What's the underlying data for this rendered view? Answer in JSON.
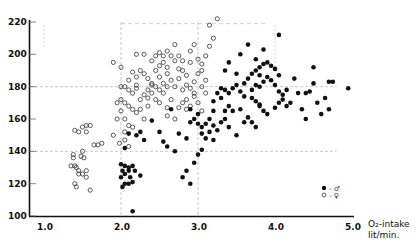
{
  "chart_data": {
    "type": "scatter",
    "title": "",
    "xlabel": "O2-intake lit/min.",
    "xlabel_line1": "O₂-intake",
    "xlabel_line2": "lit/min.",
    "ylabel": "",
    "xlim": [
      0.8,
      5.0
    ],
    "ylim": [
      100,
      220
    ],
    "xticks": [
      1.0,
      2.0,
      3.0,
      4.0,
      5.0
    ],
    "xtick_labels": [
      "1.0",
      "2.0",
      "3.0",
      "4.0",
      "5.0"
    ],
    "yticks": [
      100,
      120,
      140,
      160,
      180,
      200,
      220
    ],
    "ytick_labels": [
      "100",
      "120",
      "140",
      "160",
      "180",
      "200",
      "220"
    ],
    "grid": {
      "x": [
        2.0,
        3.0
      ],
      "y": [
        140,
        180
      ],
      "style": "dashed-light"
    },
    "legend": [
      {
        "marker": "filled-circle",
        "label": "♂",
        "text": "● - ♂"
      },
      {
        "marker": "open-circle",
        "label": "♀",
        "text": "○ - ♀"
      }
    ],
    "legend_position": "lower-right",
    "series": [
      {
        "name": "♀ (female)",
        "marker": "open-circle",
        "points": [
          [
            1.4,
            153
          ],
          [
            1.45,
            152
          ],
          [
            1.5,
            155
          ],
          [
            1.55,
            156
          ],
          [
            1.6,
            156
          ],
          [
            1.55,
            152
          ],
          [
            1.65,
            144
          ],
          [
            1.7,
            144
          ],
          [
            1.75,
            145
          ],
          [
            1.38,
            138
          ],
          [
            1.38,
            136
          ],
          [
            1.5,
            140
          ],
          [
            1.48,
            137
          ],
          [
            1.52,
            136
          ],
          [
            1.4,
            131
          ],
          [
            1.45,
            128
          ],
          [
            1.45,
            126
          ],
          [
            1.55,
            128
          ],
          [
            1.5,
            126
          ],
          [
            1.55,
            124
          ],
          [
            1.4,
            120
          ],
          [
            1.42,
            118
          ],
          [
            1.6,
            116
          ],
          [
            1.35,
            131
          ],
          [
            1.42,
            130
          ],
          [
            1.9,
            150
          ],
          [
            1.95,
            160
          ],
          [
            2.0,
            165
          ],
          [
            2.05,
            160
          ],
          [
            2.1,
            156
          ],
          [
            2.05,
            152
          ],
          [
            2.15,
            155
          ],
          [
            2.05,
            147
          ],
          [
            2.1,
            143
          ],
          [
            1.98,
            145
          ],
          [
            1.95,
            170
          ],
          [
            2.0,
            172
          ],
          [
            2.05,
            170
          ],
          [
            2.1,
            168
          ],
          [
            2.15,
            166
          ],
          [
            2.2,
            164
          ],
          [
            2.0,
            180
          ],
          [
            2.05,
            180
          ],
          [
            2.1,
            178
          ],
          [
            2.15,
            176
          ],
          [
            2.2,
            181
          ],
          [
            2.0,
            192
          ],
          [
            2.1,
            184
          ],
          [
            2.2,
            186
          ],
          [
            2.25,
            190
          ],
          [
            2.3,
            188
          ],
          [
            2.35,
            185
          ],
          [
            2.4,
            182
          ],
          [
            2.3,
            175
          ],
          [
            2.25,
            172
          ],
          [
            2.35,
            178
          ],
          [
            2.4,
            176
          ],
          [
            2.45,
            180
          ],
          [
            2.5,
            186
          ],
          [
            2.55,
            182
          ],
          [
            2.45,
            190
          ],
          [
            2.5,
            193
          ],
          [
            2.55,
            195
          ],
          [
            2.6,
            188
          ],
          [
            2.65,
            184
          ],
          [
            2.7,
            180
          ],
          [
            2.75,
            185
          ],
          [
            2.8,
            190
          ],
          [
            2.85,
            187
          ],
          [
            2.6,
            192
          ],
          [
            2.7,
            196
          ],
          [
            2.75,
            199
          ],
          [
            2.8,
            196
          ],
          [
            2.9,
            195
          ],
          [
            2.95,
            183
          ],
          [
            3.0,
            188
          ],
          [
            3.05,
            194
          ],
          [
            3.1,
            199
          ],
          [
            3.15,
            205
          ],
          [
            3.1,
            184
          ],
          [
            3.05,
            180
          ],
          [
            2.95,
            176
          ],
          [
            2.9,
            179
          ],
          [
            2.85,
            172
          ],
          [
            2.8,
            170
          ],
          [
            2.65,
            172
          ],
          [
            2.55,
            176
          ],
          [
            2.45,
            172
          ],
          [
            2.35,
            168
          ],
          [
            2.25,
            166
          ],
          [
            2.3,
            160
          ],
          [
            2.6,
            162
          ],
          [
            2.7,
            160
          ],
          [
            2.9,
            168
          ],
          [
            3.0,
            170
          ],
          [
            3.05,
            165
          ],
          [
            2.8,
            178
          ],
          [
            2.6,
            180
          ],
          [
            2.5,
            178
          ],
          [
            2.4,
            181
          ],
          [
            2.2,
            179
          ],
          [
            2.15,
            189
          ],
          [
            1.9,
            195
          ],
          [
            2.6,
            202
          ],
          [
            2.5,
            201
          ],
          [
            2.45,
            199
          ],
          [
            2.2,
            200
          ],
          [
            2.3,
            200
          ],
          [
            2.9,
            202
          ],
          [
            2.95,
            206
          ],
          [
            3.15,
            218
          ],
          [
            3.25,
            222
          ],
          [
            3.2,
            210
          ],
          [
            2.7,
            206
          ],
          [
            2.4,
            196
          ],
          [
            2.55,
            199
          ],
          [
            2.65,
            199
          ],
          [
            3.0,
            197
          ],
          [
            3.05,
            190
          ],
          [
            2.75,
            191
          ],
          [
            2.85,
            181
          ],
          [
            3.1,
            176
          ],
          [
            2.95,
            174
          ],
          [
            2.85,
            166
          ],
          [
            2.5,
            170
          ],
          [
            2.35,
            173
          ],
          [
            2.6,
            167
          ],
          [
            2.75,
            167
          ]
        ]
      },
      {
        "name": "♂ (male)",
        "marker": "filled-circle",
        "points": [
          [
            2.0,
            132
          ],
          [
            2.05,
            131
          ],
          [
            2.1,
            130
          ],
          [
            2.15,
            131
          ],
          [
            2.02,
            128
          ],
          [
            2.05,
            126
          ],
          [
            2.1,
            128
          ],
          [
            2.12,
            124
          ],
          [
            2.18,
            128
          ],
          [
            2.0,
            124
          ],
          [
            2.05,
            120
          ],
          [
            2.02,
            118
          ],
          [
            2.1,
            120
          ],
          [
            2.15,
            121
          ],
          [
            2.25,
            125
          ],
          [
            2.05,
            142
          ],
          [
            2.1,
            151
          ],
          [
            2.2,
            150
          ],
          [
            2.25,
            152
          ],
          [
            2.3,
            147
          ],
          [
            2.4,
            159
          ],
          [
            2.5,
            152
          ],
          [
            2.55,
            146
          ],
          [
            2.6,
            143
          ],
          [
            2.7,
            140
          ],
          [
            2.75,
            151
          ],
          [
            2.85,
            148
          ],
          [
            2.9,
            158
          ],
          [
            2.8,
            124
          ],
          [
            2.85,
            128
          ],
          [
            2.9,
            120
          ],
          [
            2.95,
            133
          ],
          [
            3.0,
            138
          ],
          [
            3.05,
            141
          ],
          [
            3.1,
            148
          ],
          [
            3.15,
            152
          ],
          [
            3.2,
            147
          ],
          [
            3.25,
            153
          ],
          [
            2.65,
            166
          ],
          [
            2.9,
            166
          ],
          [
            3.0,
            157
          ],
          [
            3.05,
            155
          ],
          [
            3.1,
            157
          ],
          [
            3.15,
            160
          ],
          [
            3.2,
            156
          ],
          [
            3.3,
            158
          ],
          [
            3.35,
            160
          ],
          [
            3.4,
            155
          ],
          [
            3.5,
            150
          ],
          [
            3.55,
            166
          ],
          [
            3.6,
            158
          ],
          [
            3.2,
            171
          ],
          [
            3.25,
            176
          ],
          [
            3.3,
            179
          ],
          [
            3.35,
            178
          ],
          [
            3.4,
            176
          ],
          [
            3.45,
            179
          ],
          [
            3.5,
            181
          ],
          [
            3.55,
            177
          ],
          [
            3.6,
            174
          ],
          [
            3.3,
            173
          ],
          [
            3.4,
            168
          ],
          [
            3.45,
            165
          ],
          [
            3.35,
            165
          ],
          [
            3.2,
            165
          ],
          [
            3.7,
            173
          ],
          [
            3.75,
            171
          ],
          [
            3.8,
            169
          ],
          [
            3.6,
            182
          ],
          [
            3.65,
            185
          ],
          [
            3.7,
            188
          ],
          [
            3.75,
            190
          ],
          [
            3.8,
            192
          ],
          [
            3.85,
            194
          ],
          [
            3.9,
            195
          ],
          [
            3.95,
            193
          ],
          [
            4.0,
            191
          ],
          [
            4.05,
            187
          ],
          [
            3.7,
            178
          ],
          [
            3.75,
            181
          ],
          [
            3.8,
            180
          ],
          [
            3.85,
            183
          ],
          [
            3.9,
            186
          ],
          [
            3.95,
            184
          ],
          [
            4.0,
            181
          ],
          [
            4.05,
            177
          ],
          [
            4.1,
            175
          ],
          [
            4.15,
            178
          ],
          [
            3.8,
            168
          ],
          [
            3.85,
            165
          ],
          [
            3.9,
            163
          ],
          [
            4.0,
            167
          ],
          [
            4.05,
            170
          ],
          [
            4.1,
            172
          ],
          [
            4.15,
            168
          ],
          [
            3.65,
            161
          ],
          [
            3.7,
            158
          ],
          [
            3.75,
            155
          ],
          [
            3.4,
            195
          ],
          [
            3.5,
            188
          ],
          [
            3.35,
            190
          ],
          [
            3.55,
            200
          ],
          [
            3.65,
            206
          ],
          [
            3.85,
            203
          ],
          [
            4.05,
            212
          ],
          [
            3.75,
            197
          ],
          [
            3.8,
            187
          ],
          [
            4.2,
            170
          ],
          [
            4.3,
            176
          ],
          [
            4.4,
            176
          ],
          [
            4.5,
            182
          ],
          [
            4.45,
            177
          ],
          [
            4.35,
            166
          ],
          [
            4.6,
            163
          ],
          [
            4.55,
            170
          ],
          [
            4.7,
            183
          ],
          [
            4.75,
            183
          ],
          [
            4.65,
            173
          ],
          [
            4.7,
            166
          ],
          [
            4.95,
            179
          ],
          [
            4.5,
            192
          ],
          [
            4.25,
            185
          ],
          [
            4.4,
            160
          ],
          [
            2.15,
            103
          ],
          [
            3.05,
            151
          ],
          [
            2.95,
            160
          ],
          [
            3.0,
            163
          ]
        ]
      }
    ]
  }
}
